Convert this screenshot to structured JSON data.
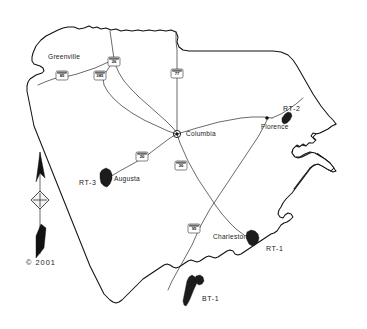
{
  "map": {
    "title": "South Carolina site location map",
    "copyright": "© 2001",
    "background_color": "#ffffff",
    "outline_color": "#111111",
    "highway_color": "#3a3a3a",
    "site_fill_color": "#1c1c1c"
  },
  "cities": [
    {
      "name": "Greenville",
      "x": 78,
      "y": 57,
      "dot_x": 113,
      "dot_y": 60,
      "anchor": "right"
    },
    {
      "name": "Columbia",
      "x": 186,
      "y": 134,
      "dot_x": 178,
      "dot_y": 134,
      "anchor": "left",
      "capital": true
    },
    {
      "name": "Florence",
      "x": 266,
      "y": 127,
      "dot_x": 267,
      "dot_y": 118,
      "anchor": "left"
    },
    {
      "name": "Augusta",
      "x": 114,
      "y": 180,
      "dot_x": 110,
      "dot_y": 177,
      "anchor": "left"
    },
    {
      "name": "Charleston",
      "x": 213,
      "y": 237,
      "dot_x": 250,
      "dot_y": 236,
      "anchor": "left"
    }
  ],
  "sites": [
    {
      "label": "RT-1",
      "x": 266,
      "y": 248,
      "anchor": "left"
    },
    {
      "label": "RT-2",
      "x": 283,
      "y": 108,
      "anchor": "left"
    },
    {
      "label": "RT-3",
      "x": 81,
      "y": 182,
      "anchor": "left"
    },
    {
      "label": "BT-1",
      "x": 200,
      "y": 298,
      "anchor": "left"
    }
  ],
  "highway_shields": [
    {
      "route": "85",
      "x": 62,
      "y": 76
    },
    {
      "route": "385",
      "x": 100,
      "y": 76
    },
    {
      "route": "26",
      "x": 114,
      "y": 62
    },
    {
      "route": "77",
      "x": 177,
      "y": 74
    },
    {
      "route": "20",
      "x": 142,
      "y": 157
    },
    {
      "route": "26",
      "x": 181,
      "y": 166
    },
    {
      "route": "95",
      "x": 194,
      "y": 229
    }
  ],
  "compass": {
    "label_north": "N",
    "x": 40,
    "y": 200
  }
}
